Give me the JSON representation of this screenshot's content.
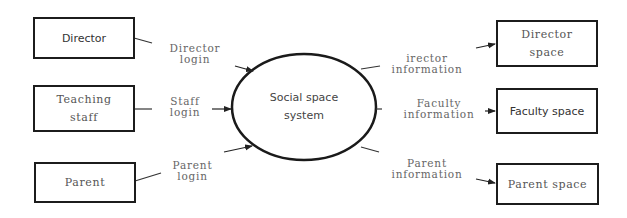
{
  "diagram": {
    "type": "context data-flow diagram",
    "center": {
      "label_line1": "Social space",
      "label_line2": "system"
    },
    "sources": [
      {
        "id": "director",
        "label": "Director"
      },
      {
        "id": "teaching-staff",
        "label_line1": "Teaching",
        "label_line2": "staff"
      },
      {
        "id": "parent",
        "label": "Parent"
      }
    ],
    "inputs": [
      {
        "from": "director",
        "label_line1": "Director",
        "label_line2": "login"
      },
      {
        "from": "teaching-staff",
        "label_line1": "Staff",
        "label_line2": "login"
      },
      {
        "from": "parent",
        "label_line1": "Parent",
        "label_line2": "login"
      }
    ],
    "outputs": [
      {
        "to": "director-space",
        "label_line1": "irector",
        "label_line2": "information"
      },
      {
        "to": "faculty-space",
        "label_line1": "Faculty",
        "label_line2": "information"
      },
      {
        "to": "parent-space",
        "label_line1": "Parent",
        "label_line2": "information"
      }
    ],
    "sinks": [
      {
        "id": "director-space",
        "label_line1": "Director",
        "label_line2": "space"
      },
      {
        "id": "faculty-space",
        "label": "Faculty space"
      },
      {
        "id": "parent-space",
        "label": "Parent space"
      }
    ]
  }
}
